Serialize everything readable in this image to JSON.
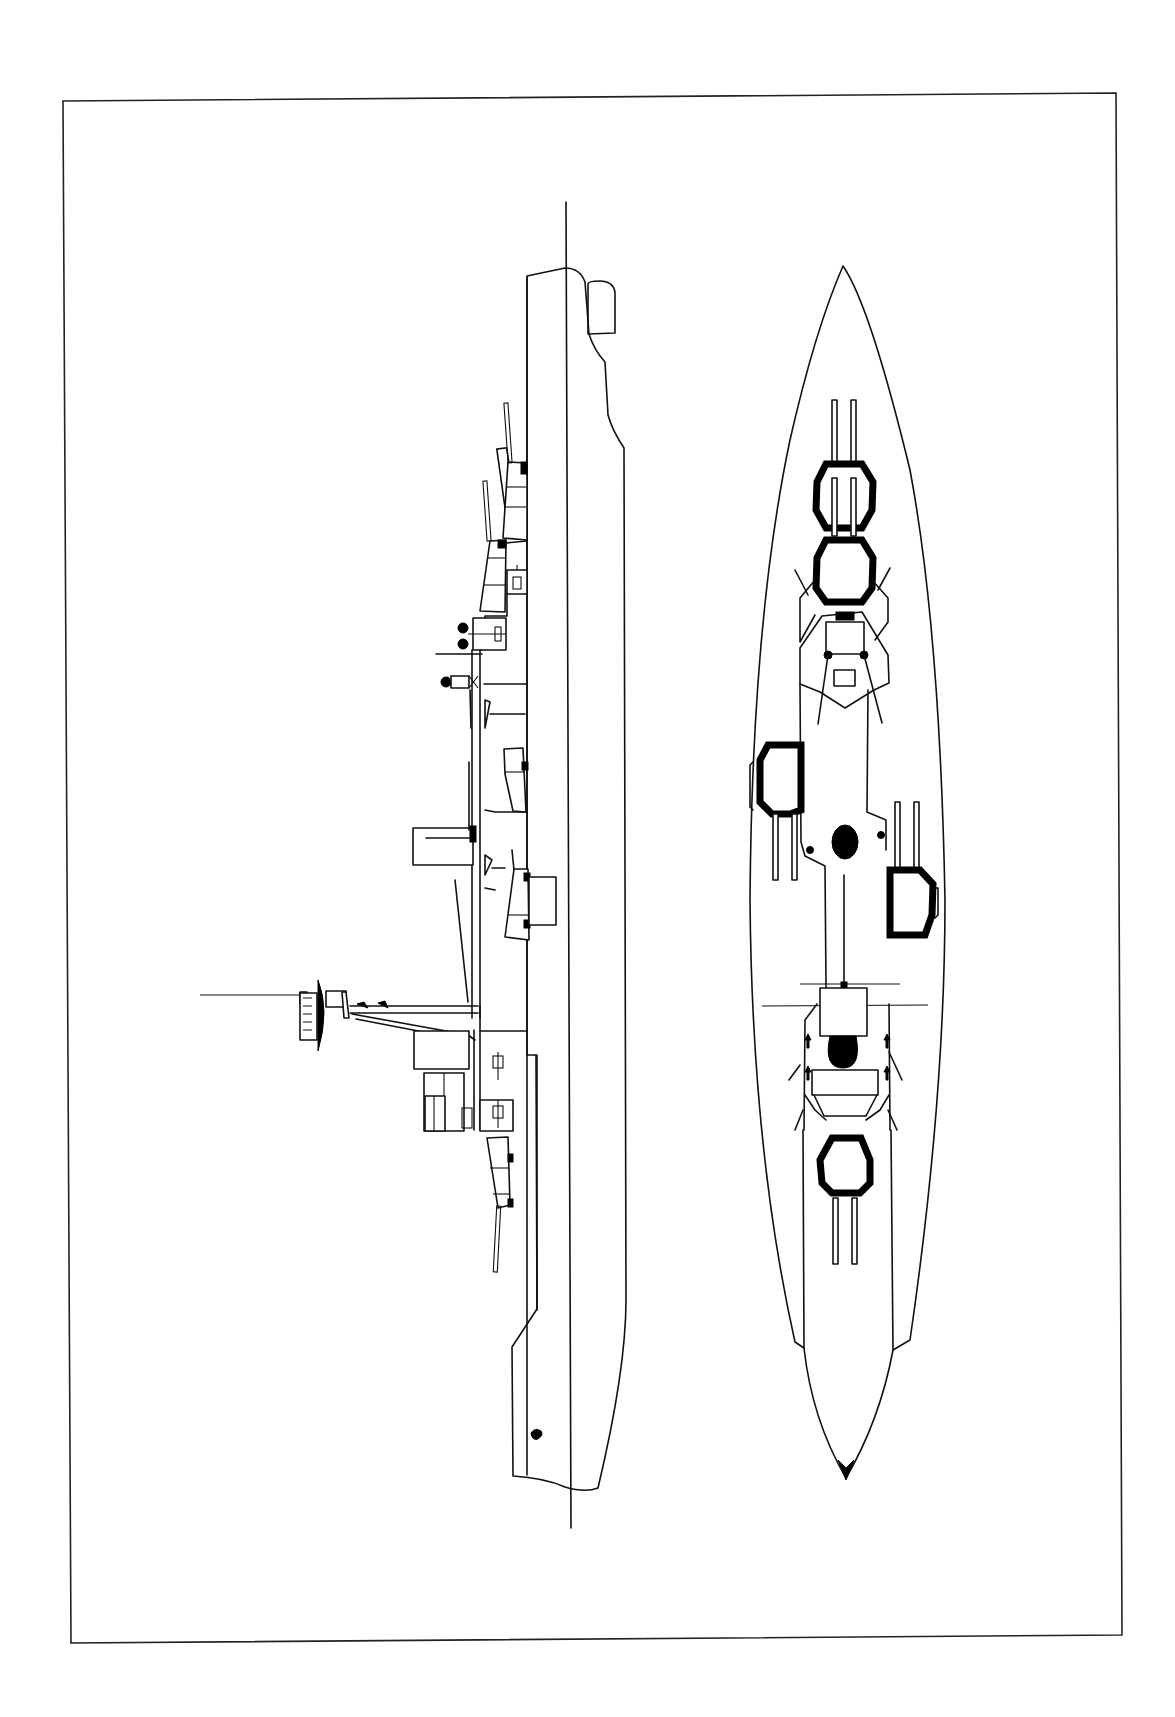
{
  "drawing": {
    "subject": "warship line drawing",
    "views": [
      "side-profile",
      "top-plan"
    ],
    "orientation": "rotated 90 degrees, bow at top",
    "colors": {
      "ink": "#111111",
      "paper": "#ffffff"
    }
  },
  "side_profile": {
    "main_turrets_visible": 4,
    "features": [
      "bow-bulb",
      "forward-turret-a",
      "forward-turret-b",
      "bridge-superstructure",
      "funnel",
      "midship-turret-upper",
      "midship-turret-lower",
      "tripod-mast-with-yard",
      "aft-superstructure",
      "aft-turret",
      "stern-anchor"
    ]
  },
  "plan_view": {
    "main_turrets_visible": 5,
    "features": [
      "forward-turret-a",
      "forward-turret-b",
      "bridge",
      "wing-turret-port",
      "funnel-cap",
      "wing-turret-starboard",
      "mainmast-platform",
      "aft-funnel-cap",
      "aft-deckhouse",
      "aft-turret"
    ]
  }
}
